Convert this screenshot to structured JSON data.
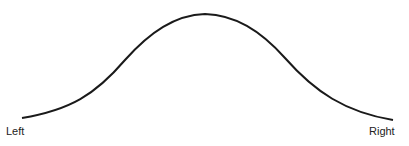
{
  "diagram": {
    "type": "bell-curve",
    "labels": {
      "left": "Left",
      "right": "Right"
    },
    "curve": {
      "start": [
        22,
        118
      ],
      "peak": [
        205,
        14
      ],
      "end": [
        393,
        120
      ],
      "stroke": "#1a1a1a"
    }
  }
}
